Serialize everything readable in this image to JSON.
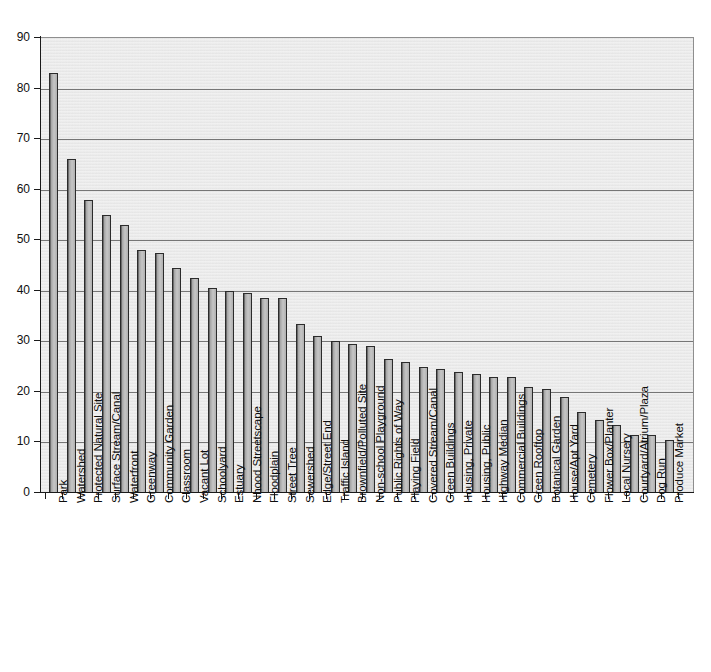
{
  "chart_data": {
    "type": "bar",
    "title": "",
    "subtitle": "",
    "xlabel": "",
    "ylabel": "",
    "ylim": [
      0,
      90
    ],
    "ytick_step": 10,
    "yticks": [
      0,
      10,
      20,
      30,
      40,
      50,
      60,
      70,
      80,
      90
    ],
    "grid": true,
    "legend": false,
    "legend_position": "none",
    "orientation": "vertical",
    "xtick_label_rotation": -90,
    "categories": [
      "Park",
      "Watershed",
      "Protected Natural Site",
      "Surface Stream/Canal",
      "Waterfront",
      "Greenway",
      "Community Garden",
      "Classroom",
      "Vacant Lot",
      "Schoolyard",
      "Estuary",
      "Nhood Streetscape",
      "Floodplain",
      "Street Tree",
      "Sewershed",
      "Edge/Street End",
      "Traffic Island",
      "Brownfield/Polluted Site",
      "Non-school Playground",
      "Public Rights of Way",
      "Playing Field",
      "Covered Stream/Canal",
      "Green Buildings",
      "Housing, Private",
      "Housing, Public",
      "Highway Median",
      "Commercial Buildings",
      "Green  Rooftop",
      "Botanical Garden",
      "House/Apt Yard",
      "Cemetery",
      "Flower Box/Planter",
      "Local Nursery",
      "Courtyard/Atrium/Plaza",
      "Dog Run",
      "Produce Market"
    ],
    "values": [
      83,
      66,
      58,
      55,
      53,
      48,
      47.5,
      44.5,
      42.5,
      40.5,
      40,
      39.5,
      38.5,
      38.5,
      33.5,
      31,
      30,
      29.5,
      29,
      26.5,
      26,
      25,
      24.5,
      24,
      23.5,
      23,
      23,
      21,
      20.5,
      19,
      16,
      14.5,
      13.5,
      11.5,
      11.5,
      10.5
    ]
  },
  "axis": {
    "y_labels": [
      "90",
      "80",
      "70",
      "60",
      "50",
      "40",
      "30",
      "20",
      "10",
      "0"
    ]
  },
  "colors": {
    "bar_fill": "#b0b0b0",
    "bar_edge": "#2b2b2b",
    "plot_background": "#e9e9e9",
    "gridline": "#767676",
    "axis": "#1a1a1a",
    "text": "#0d0d0d"
  }
}
